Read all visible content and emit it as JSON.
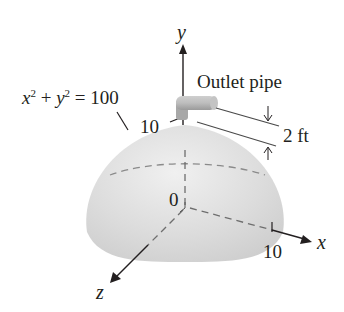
{
  "figure": {
    "equation": {
      "x_var": "x",
      "y_var": "y",
      "exponent": "2",
      "plus": "+",
      "equals": "=",
      "value": "100"
    },
    "labels": {
      "outlet_pipe": "Outlet pipe",
      "pipe_height": "2 ft",
      "y_tick": "10",
      "x_tick": "10",
      "origin": "0"
    },
    "axes": {
      "x": "x",
      "y": "y",
      "z": "z"
    },
    "colors": {
      "hemisphere_fill": "#d9d9d9",
      "hemisphere_edge": "#c8c8c8",
      "ink": "#231f20",
      "dashed": "#808080",
      "pipe": "#b0b0b0"
    }
  }
}
